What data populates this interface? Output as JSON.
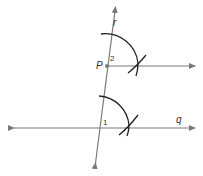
{
  "diagram": {
    "labels": {
      "point": "P",
      "transversal": "r",
      "line": "q",
      "angle_bottom": "1",
      "angle_top": "2"
    },
    "colors": {
      "line": "#7a7a7a",
      "arc": "#222222",
      "point": "#7a7a7a",
      "text": "#333333"
    }
  }
}
